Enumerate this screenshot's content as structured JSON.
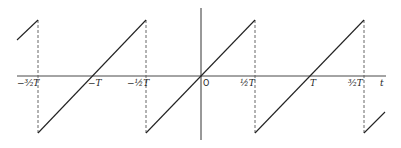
{
  "diagram": {
    "type": "sawtooth-wave",
    "colors": {
      "line": "#222222",
      "dash": "#555555",
      "background": "#ffffff"
    },
    "axis_labels": {
      "t": "t",
      "origin": "O"
    },
    "tick_labels": [
      {
        "id": "neg-three-halves-T",
        "text": "−³⁄₂T"
      },
      {
        "id": "neg-T",
        "text": "−T"
      },
      {
        "id": "neg-half-T",
        "text": "−½T"
      },
      {
        "id": "half-T",
        "text": "½T"
      },
      {
        "id": "T",
        "text": "T"
      },
      {
        "id": "three-halves-T",
        "text": "³⁄₂T"
      }
    ]
  }
}
